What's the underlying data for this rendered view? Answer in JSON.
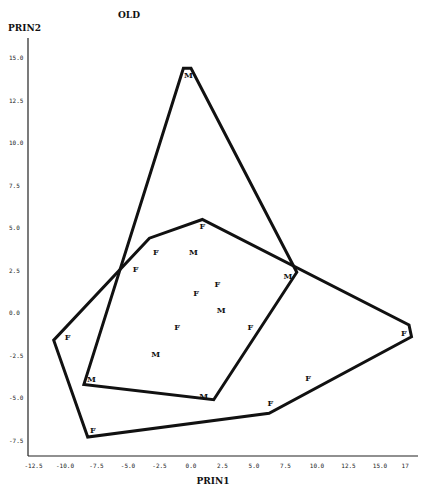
{
  "chart_data": {
    "type": "scatter",
    "title": "OLD",
    "xlabel": "PRIN1",
    "ylabel": "PRIN2",
    "xlim": [
      -12.5,
      17
    ],
    "ylim": [
      -8.5,
      16
    ],
    "x_ticks": [
      "-12.5",
      "-10.0",
      "-7.5",
      "-5.0",
      "-2.5",
      "0.0",
      "2.5",
      "5.0",
      "7.5",
      "10.0",
      "12.5",
      "15.0",
      "17"
    ],
    "y_ticks": [
      "15.0",
      "12.5",
      "10.0",
      "7.5",
      "5.0",
      "2.5",
      "0.0",
      "-2.5",
      "-5.0",
      "-7.5"
    ],
    "grid": false,
    "legend": null,
    "series": [
      {
        "name": "M",
        "marker": "M",
        "points": [
          {
            "x": -0.2,
            "y": 14.0
          },
          {
            "x": 0.2,
            "y": 3.6
          },
          {
            "x": 2.4,
            "y": 0.2
          },
          {
            "x": -2.8,
            "y": -2.4
          },
          {
            "x": -7.9,
            "y": -3.9
          },
          {
            "x": 1.0,
            "y": -4.9
          },
          {
            "x": 7.7,
            "y": 2.2
          }
        ],
        "hull": [
          {
            "x": -0.6,
            "y": 14.4
          },
          {
            "x": 0.0,
            "y": 14.4
          },
          {
            "x": 8.4,
            "y": 2.4
          },
          {
            "x": 1.8,
            "y": -5.1
          },
          {
            "x": -8.5,
            "y": -4.2
          }
        ]
      },
      {
        "name": "F",
        "marker": "F",
        "points": [
          {
            "x": 0.9,
            "y": 5.1
          },
          {
            "x": -2.8,
            "y": 3.6
          },
          {
            "x": -4.4,
            "y": 2.6
          },
          {
            "x": 2.1,
            "y": 1.7
          },
          {
            "x": 0.4,
            "y": 1.2
          },
          {
            "x": 4.7,
            "y": -0.8
          },
          {
            "x": -1.1,
            "y": -0.8
          },
          {
            "x": -9.8,
            "y": -1.4
          },
          {
            "x": 16.9,
            "y": -1.2
          },
          {
            "x": 9.3,
            "y": -3.8
          },
          {
            "x": 6.3,
            "y": -5.3
          },
          {
            "x": -7.8,
            "y": -6.9
          }
        ],
        "hull": [
          {
            "x": 0.9,
            "y": 5.5
          },
          {
            "x": -3.3,
            "y": 4.4
          },
          {
            "x": -10.9,
            "y": -1.6
          },
          {
            "x": -8.2,
            "y": -7.3
          },
          {
            "x": 6.2,
            "y": -5.9
          },
          {
            "x": 17.5,
            "y": -1.4
          },
          {
            "x": 17.3,
            "y": -0.7
          }
        ]
      }
    ]
  }
}
